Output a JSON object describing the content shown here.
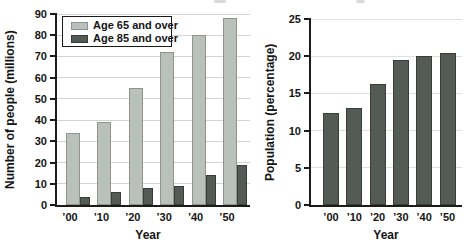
{
  "colors": {
    "axis": "#1b1b1b",
    "text": "#151515",
    "legend_border": "#1b1b1b",
    "legend_bg": "#ffffff"
  },
  "chart_data": [
    {
      "type": "bar",
      "categories": [
        "’00",
        "’10",
        "’20",
        "’30",
        "’40",
        "’50"
      ],
      "series": [
        {
          "name": "Age 65 and over",
          "values": [
            34,
            39,
            55,
            72,
            80,
            88
          ],
          "fill": "#bac0bb",
          "border": "#8e948f"
        },
        {
          "name": "Age 85 and over",
          "values": [
            4,
            6,
            8,
            9,
            14,
            19
          ],
          "fill": "#545a56",
          "border": "#383e3a"
        }
      ],
      "title": "",
      "xlabel": "Year",
      "ylabel": "Number of people (millions)",
      "ylim": [
        0,
        90
      ],
      "ytick_step": 10,
      "grid": true,
      "grid_color": "#d4d4d4",
      "legend_position": "top-left"
    },
    {
      "type": "bar",
      "categories": [
        "’00",
        "’10",
        "’20",
        "’30",
        "’40",
        "’50"
      ],
      "series": [
        {
          "name": "",
          "values": [
            12.3,
            13,
            16.2,
            19.5,
            20,
            20.4
          ],
          "fill": "#545a56",
          "border": "#383e3a"
        }
      ],
      "title": "",
      "xlabel": "Year",
      "ylabel": "Population (percentage)",
      "ylim": [
        0,
        25
      ],
      "ytick_step": 5,
      "grid": true,
      "grid_color": "#dfdfdf",
      "legend_position": "none"
    }
  ]
}
